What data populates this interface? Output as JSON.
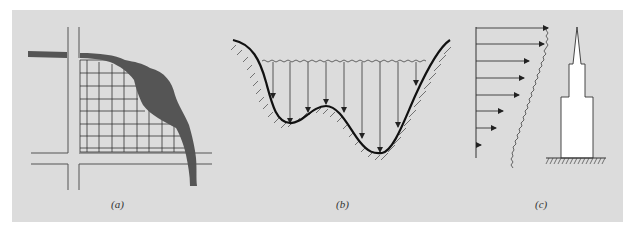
{
  "figure": {
    "panels": [
      {
        "id": "a",
        "caption": "(a)",
        "description": "Gridded land area bounded by roads and a river"
      },
      {
        "id": "b",
        "caption": "(b)",
        "description": "Water body over uneven basin with vertical pressure arrows"
      },
      {
        "id": "c",
        "caption": "(c)",
        "description": "Wind load distribution on a tall tower"
      }
    ]
  },
  "colors": {
    "panel_background": "#dcdcdc",
    "river": "#555555",
    "line": "#222222",
    "tower_fill": "#ffffff"
  }
}
